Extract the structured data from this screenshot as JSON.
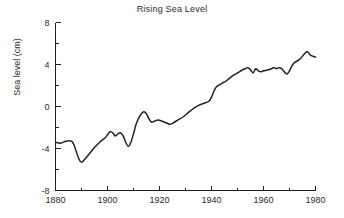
{
  "chart_data": {
    "type": "line",
    "title": "Rising Sea Level",
    "xlabel": "",
    "ylabel": "Sea level (cm)",
    "xlim": [
      1880,
      1980
    ],
    "ylim": [
      -8,
      8
    ],
    "grid": false,
    "legend": false,
    "line_color": "#231f20",
    "background_color": "#ffffff",
    "x_major_ticks": [
      1880,
      1900,
      1920,
      1940,
      1960,
      1980
    ],
    "x_major_tick_labels": [
      "1880",
      "1900",
      "1920",
      "1940",
      "1960",
      "1980"
    ],
    "x_minor_ticks": [
      1890,
      1910,
      1930,
      1950,
      1970
    ],
    "y_major_ticks": [
      -8,
      -4,
      0,
      4,
      8
    ],
    "y_major_tick_labels": [
      "-8",
      "-4",
      "0",
      "4",
      "8"
    ],
    "y_minor_ticks": [
      -6,
      -2,
      2,
      6
    ],
    "series": [
      {
        "name": "Sea level",
        "x": [
          1880,
          1882,
          1884,
          1886,
          1887,
          1889,
          1890,
          1891,
          1893,
          1895,
          1897,
          1899,
          1900,
          1901,
          1902,
          1903,
          1904,
          1905,
          1906,
          1907,
          1908,
          1909,
          1910,
          1911,
          1912,
          1913,
          1914,
          1915,
          1916,
          1917,
          1918,
          1919,
          1920,
          1921,
          1922,
          1923,
          1924,
          1925,
          1927,
          1929,
          1931,
          1933,
          1935,
          1937,
          1939,
          1940,
          1941,
          1942,
          1944,
          1946,
          1948,
          1950,
          1952,
          1953,
          1954,
          1955,
          1956,
          1957,
          1958,
          1959,
          1960,
          1962,
          1964,
          1965,
          1966,
          1967,
          1968,
          1969,
          1970,
          1971,
          1972,
          1974,
          1976,
          1977,
          1978,
          1980
        ],
        "y": [
          -3.4,
          -3.5,
          -3.3,
          -3.3,
          -3.6,
          -5.0,
          -5.3,
          -5.1,
          -4.5,
          -3.9,
          -3.4,
          -3.0,
          -2.7,
          -2.4,
          -2.5,
          -2.8,
          -2.6,
          -2.5,
          -2.8,
          -3.4,
          -3.8,
          -3.4,
          -2.6,
          -1.7,
          -1.1,
          -0.7,
          -0.5,
          -0.7,
          -1.2,
          -1.5,
          -1.4,
          -1.3,
          -1.3,
          -1.4,
          -1.5,
          -1.6,
          -1.7,
          -1.6,
          -1.3,
          -1.0,
          -0.6,
          -0.2,
          0.1,
          0.3,
          0.5,
          0.9,
          1.5,
          1.9,
          2.2,
          2.5,
          2.9,
          3.2,
          3.5,
          3.6,
          3.7,
          3.5,
          3.2,
          3.6,
          3.4,
          3.3,
          3.4,
          3.5,
          3.7,
          3.6,
          3.7,
          3.6,
          3.3,
          3.1,
          3.4,
          3.9,
          4.2,
          4.5,
          5.1,
          5.2,
          4.9,
          4.7
        ]
      }
    ]
  },
  "axes": {
    "y_axis_label": "Sea level (cm)"
  }
}
